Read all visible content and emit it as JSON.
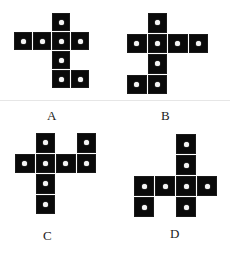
{
  "options": [
    {
      "label": "A",
      "origin": [
        14,
        13
      ],
      "step": 19,
      "label_pos": [
        47,
        108
      ],
      "cells": [
        [
          2,
          0
        ],
        [
          0,
          1
        ],
        [
          1,
          1
        ],
        [
          2,
          1
        ],
        [
          3,
          1
        ],
        [
          2,
          2
        ],
        [
          2,
          3
        ],
        [
          3,
          3
        ]
      ]
    },
    {
      "label": "B",
      "origin": [
        127,
        13
      ],
      "step": 20.5,
      "label_pos": [
        161,
        108
      ],
      "cells": [
        [
          1,
          0
        ],
        [
          0,
          1
        ],
        [
          1,
          1
        ],
        [
          2,
          1
        ],
        [
          3,
          1
        ],
        [
          1,
          2
        ],
        [
          0,
          3
        ],
        [
          1,
          3
        ]
      ]
    },
    {
      "label": "C",
      "origin": [
        15,
        133
      ],
      "step": 20.5,
      "label_pos": [
        43,
        228
      ],
      "cells": [
        [
          1,
          0
        ],
        [
          3,
          0
        ],
        [
          0,
          1
        ],
        [
          1,
          1
        ],
        [
          2,
          1
        ],
        [
          3,
          1
        ],
        [
          1,
          2
        ],
        [
          1,
          3
        ]
      ]
    },
    {
      "label": "D",
      "origin": [
        134,
        134
      ],
      "step": 21,
      "label_pos": [
        170,
        226
      ],
      "cells": [
        [
          2,
          0
        ],
        [
          2,
          1
        ],
        [
          0,
          2
        ],
        [
          1,
          2
        ],
        [
          2,
          2
        ],
        [
          3,
          2
        ],
        [
          0,
          3
        ],
        [
          2,
          3
        ]
      ]
    }
  ],
  "colors": {
    "square": "#0a0a0a",
    "dot": "#f5f5f5",
    "separator": "#e6e6e6"
  }
}
